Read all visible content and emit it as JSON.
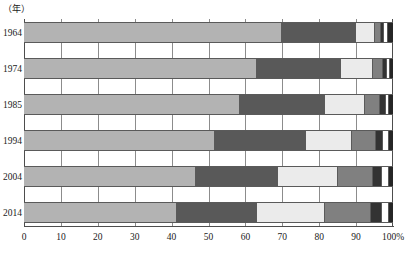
{
  "axis_unit_caption": "（年）",
  "chart_data": {
    "type": "bar",
    "orientation": "horizontal",
    "stacked": true,
    "normalized_percent": true,
    "title": "",
    "subtitle": "",
    "xlabel": "",
    "ylabel": "（年）",
    "xlim": [
      0,
      100
    ],
    "grid": true,
    "legend_position": "none",
    "xticks": [
      0,
      10,
      20,
      30,
      40,
      50,
      60,
      70,
      80,
      90,
      100
    ],
    "xtick_labels": [
      "0",
      "10",
      "20",
      "30",
      "40",
      "50",
      "60",
      "70",
      "80",
      "90",
      "100%"
    ],
    "categories": [
      "1964",
      "1974",
      "1985",
      "1994",
      "2004",
      "2014"
    ],
    "series": [
      {
        "name": "series-1",
        "color": "#b3b3b3",
        "values": [
          69.9,
          63.1,
          58.5,
          51.8,
          46.6,
          41.4
        ]
      },
      {
        "name": "series-2",
        "color": "#595959",
        "values": [
          20.1,
          22.8,
          23.0,
          24.5,
          22.3,
          21.7
        ]
      },
      {
        "name": "series-3",
        "color": "#ebebeb",
        "values": [
          5.1,
          8.7,
          10.8,
          12.6,
          16.3,
          18.4
        ]
      },
      {
        "name": "series-4",
        "color": "#808080",
        "values": [
          1.6,
          2.7,
          4.2,
          6.6,
          9.3,
          12.5
        ]
      },
      {
        "name": "series-5",
        "color": "#333333",
        "values": [
          1.0,
          1.2,
          1.6,
          1.9,
          2.5,
          3.1
        ]
      },
      {
        "name": "series-6",
        "color": "#ffffff",
        "values": [
          1.0,
          0.8,
          0.9,
          1.6,
          2.0,
          1.8
        ]
      },
      {
        "name": "series-7",
        "color": "#262626",
        "values": [
          1.3,
          0.7,
          1.0,
          1.0,
          1.0,
          1.1
        ]
      }
    ]
  },
  "colors": {
    "axis": "#4d4d4d",
    "gridline": "#8c8c8c",
    "bar_outline": "#5a5a5a",
    "text": "#1a1a1a",
    "background": "#ffffff"
  }
}
